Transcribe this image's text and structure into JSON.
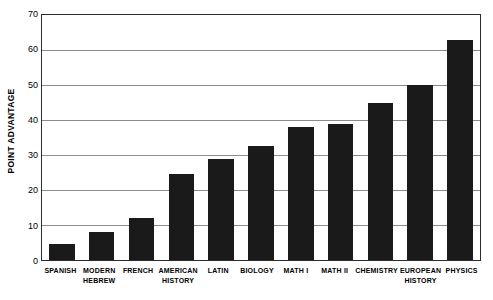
{
  "chart_data": {
    "type": "bar",
    "title": "",
    "xlabel": "",
    "ylabel": "POINT ADVANTAGE",
    "ylim": [
      0,
      70
    ],
    "ytick_step": 10,
    "yticks": [
      70,
      60,
      50,
      40,
      30,
      20,
      10,
      0
    ],
    "grid": true,
    "legend": "none",
    "orientation": "vertical",
    "bar_color": "#1a1a1a",
    "categories": [
      "SPANISH",
      "MODERN HEBREW",
      "FRENCH",
      "AMERICAN HISTORY",
      "LATIN",
      "BIOLOGY",
      "MATH I",
      "MATH II",
      "CHEMISTRY",
      "EUROPEAN HISTORY",
      "PHYSICS"
    ],
    "values": [
      4.5,
      8,
      12,
      24.5,
      29,
      32.5,
      38,
      39,
      45,
      50,
      63
    ],
    "bars": [
      {
        "label": "SPANISH",
        "label_lines": [
          "SPANISH"
        ],
        "value": 4.5
      },
      {
        "label": "MODERN HEBREW",
        "label_lines": [
          "MODERN",
          "HEBREW"
        ],
        "value": 8
      },
      {
        "label": "FRENCH",
        "label_lines": [
          "FRENCH"
        ],
        "value": 12
      },
      {
        "label": "AMERICAN HISTORY",
        "label_lines": [
          "AMERICAN",
          "HISTORY"
        ],
        "value": 24.5
      },
      {
        "label": "LATIN",
        "label_lines": [
          "LATIN"
        ],
        "value": 29
      },
      {
        "label": "BIOLOGY",
        "label_lines": [
          "BIOLOGY"
        ],
        "value": 32.5
      },
      {
        "label": "MATH I",
        "label_lines": [
          "MATH I"
        ],
        "value": 38
      },
      {
        "label": "MATH II",
        "label_lines": [
          "MATH II"
        ],
        "value": 39
      },
      {
        "label": "CHEMISTRY",
        "label_lines": [
          "CHEMISTRY"
        ],
        "value": 45
      },
      {
        "label": "EUROPEAN HISTORY",
        "label_lines": [
          "EUROPEAN",
          "HISTORY"
        ],
        "value": 50
      },
      {
        "label": "PHYSICS",
        "label_lines": [
          "PHYSICS"
        ],
        "value": 63
      }
    ]
  },
  "axis": {
    "y_title": "POINT ADVANTAGE",
    "y_tick_labels": [
      "70",
      "60",
      "50",
      "40",
      "30",
      "20",
      "10",
      "0"
    ]
  },
  "colors": {
    "bar": "#1a1a1a",
    "gridline": "#8c8c8c",
    "frame": "#2b2b2b",
    "background": "#ffffff",
    "text": "#000000"
  }
}
